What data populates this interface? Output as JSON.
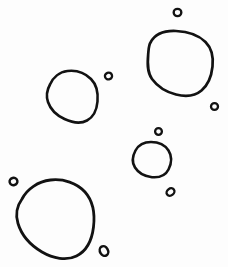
{
  "document": {
    "title": "Hand-drawn closed curves",
    "description": "Ink line drawing of five large irregular rounded closed curves and seven small ring-shaped dots scattered on a white field",
    "background_color": "#fdfdfd",
    "ink_color": "#121212",
    "width": 228,
    "height": 267
  },
  "figure": {
    "large_shape_count": "5",
    "small_dot_count": "7",
    "stroke_width_large": "2.6",
    "stroke_width_small": "2.2"
  },
  "shapes": [
    {
      "id": "blob-top-right",
      "label": "large blob top right",
      "cx": 180.5,
      "cy": 63.5,
      "width": 65,
      "height": 65,
      "stroke": "#121212",
      "stroke_width": 2.7,
      "path": "M 150.5 42.5 C 155 34 165 30.5 176 31.0 C 188 31.5 199 35.5 205.5 42.0 C 212 48.5 213.5 57.5 212.5 66.5 C 211.5 76.0 208.0 85.0 201.5 90.5 C 195.0 96.0 185.5 96.8 176.0 94.5 C 166.0 92.0 157.5 86.5 152.0 79.0 C 146.8 71.8 147.5 62.0 148.2 54.0 C 148.7 49.0 148.6 45.5 150.5 42.5 Z"
    },
    {
      "id": "blob-middle-left",
      "label": "medium blob middle left",
      "cx": 72.5,
      "cy": 96.5,
      "width": 51,
      "height": 51,
      "stroke": "#121212",
      "stroke_width": 2.6,
      "path": "M 50.0 84.5 C 53.0 77.5 59.5 72.0 67.5 71.0 C 76.0 70.0 85.0 73.0 91.0 79.0 C 96.8 84.8 98.2 93.5 97.5 101.5 C 96.8 109.5 93.5 117.0 87.0 120.5 C 80.5 124.0 72.0 122.5 64.5 119.0 C 57.0 115.5 50.5 109.5 48.0 102.0 C 45.8 95.5 47.2 89.5 50.0 84.5 Z"
    },
    {
      "id": "blob-middle-small",
      "label": "small blob center",
      "cx": 151.5,
      "cy": 159.5,
      "width": 37,
      "height": 36,
      "stroke": "#121212",
      "stroke_width": 2.6,
      "path": "M 135.5 150.5 C 138.5 145.0 144.5 142.0 151.0 142.0 C 158.0 142.0 165.0 145.0 168.5 150.5 C 172.0 156.0 171.5 163.5 168.5 169.5 C 165.5 175.5 159.0 177.8 152.0 177.2 C 145.0 176.5 138.5 173.0 135.0 167.5 C 131.5 162.0 132.8 155.5 135.5 150.5 Z"
    },
    {
      "id": "blob-bottom-left",
      "label": "large blob bottom left",
      "cx": 55.5,
      "cy": 219,
      "width": 77,
      "height": 78,
      "stroke": "#121212",
      "stroke_width": 2.8,
      "path": "M 22.0 199.0 C 27.0 189.0 38.0 181.5 50.5 180.0 C 63.5 178.5 77.0 183.0 85.0 192.0 C 93.0 201.0 95.0 214.5 93.5 227.0 C 92.0 239.5 86.5 251.0 76.5 256.0 C 66.5 261.0 53.0 258.5 42.0 252.0 C 31.0 245.5 21.5 235.0 18.0 223.5 C 14.8 212.8 17.2 205.5 22.0 199.0 Z"
    }
  ],
  "dots": [
    {
      "id": "dot-top",
      "label": "ring dot above top-right blob",
      "cx": 177.5,
      "cy": 12.5,
      "rx": 3.8,
      "ry": 3.6,
      "rotate": 0,
      "stroke_width": 2.4,
      "stroke": "#121212"
    },
    {
      "id": "dot-left-of-blob",
      "label": "ring dot right of middle-left blob",
      "cx": 108.5,
      "cy": 76.0,
      "rx": 3.6,
      "ry": 3.4,
      "rotate": -20,
      "stroke_width": 2.3,
      "stroke": "#121212"
    },
    {
      "id": "dot-right-lower",
      "label": "ring dot below right of top-right blob",
      "cx": 214.5,
      "cy": 106.5,
      "rx": 3.5,
      "ry": 3.4,
      "rotate": 0,
      "stroke_width": 2.3,
      "stroke": "#121212"
    },
    {
      "id": "dot-above-center-blob",
      "label": "ring dot above center blob",
      "cx": 158.5,
      "cy": 131.5,
      "rx": 3.4,
      "ry": 3.3,
      "rotate": 0,
      "stroke_width": 2.3,
      "stroke": "#121212"
    },
    {
      "id": "dot-below-center-blob",
      "label": "ring dot below center blob",
      "cx": 170.5,
      "cy": 192.0,
      "rx": 4.2,
      "ry": 3.4,
      "rotate": -38,
      "stroke_width": 2.4,
      "stroke": "#121212"
    },
    {
      "id": "dot-far-left",
      "label": "ring dot upper left of bottom-left blob",
      "cx": 13.5,
      "cy": 181.5,
      "rx": 3.9,
      "ry": 3.6,
      "rotate": -15,
      "stroke_width": 2.5,
      "stroke": "#121212"
    },
    {
      "id": "dot-bottom-right",
      "label": "ring dot right of bottom-left blob",
      "cx": 104.0,
      "cy": 251.0,
      "rx": 4.0,
      "ry": 5.0,
      "rotate": -30,
      "stroke_width": 2.5,
      "stroke": "#121212"
    }
  ]
}
